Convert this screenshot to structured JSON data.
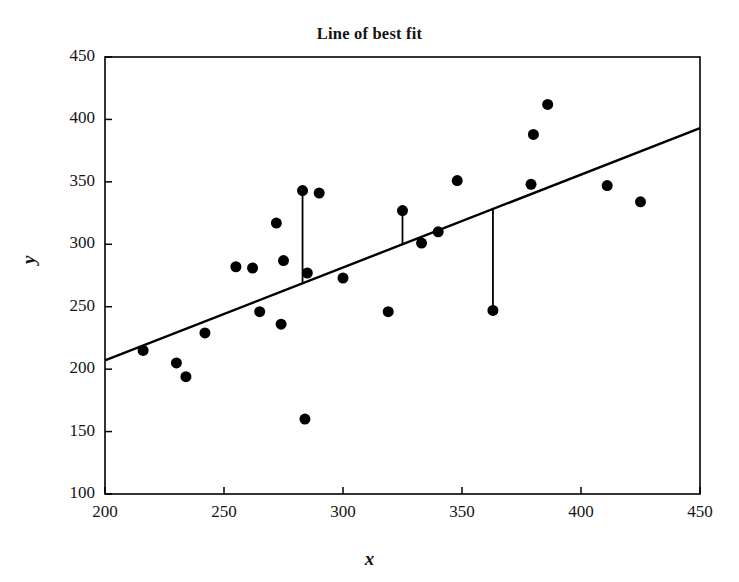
{
  "chart_data": {
    "type": "scatter",
    "title": "Line of best fit",
    "xlabel": "x",
    "ylabel": "y",
    "xlim": [
      200,
      450
    ],
    "ylim": [
      100,
      450
    ],
    "xticks": [
      200,
      250,
      300,
      350,
      400,
      450
    ],
    "yticks": [
      100,
      150,
      200,
      250,
      300,
      350,
      400,
      450
    ],
    "grid": false,
    "legend": null,
    "marker_color": "#000000",
    "line_color": "#000000",
    "marker_size": 11,
    "points": [
      {
        "x": 216,
        "y": 215
      },
      {
        "x": 230,
        "y": 205
      },
      {
        "x": 234,
        "y": 194
      },
      {
        "x": 242,
        "y": 229
      },
      {
        "x": 255,
        "y": 282
      },
      {
        "x": 262,
        "y": 281
      },
      {
        "x": 265,
        "y": 246
      },
      {
        "x": 272,
        "y": 317
      },
      {
        "x": 274,
        "y": 236
      },
      {
        "x": 275,
        "y": 287
      },
      {
        "x": 283,
        "y": 343
      },
      {
        "x": 284,
        "y": 160
      },
      {
        "x": 285,
        "y": 277
      },
      {
        "x": 290,
        "y": 341
      },
      {
        "x": 300,
        "y": 273
      },
      {
        "x": 319,
        "y": 246
      },
      {
        "x": 325,
        "y": 327
      },
      {
        "x": 333,
        "y": 301
      },
      {
        "x": 340,
        "y": 310
      },
      {
        "x": 348,
        "y": 351
      },
      {
        "x": 363,
        "y": 247
      },
      {
        "x": 379,
        "y": 348
      },
      {
        "x": 380,
        "y": 388
      },
      {
        "x": 386,
        "y": 412
      },
      {
        "x": 411,
        "y": 347
      },
      {
        "x": 425,
        "y": 334
      }
    ],
    "fit_line": {
      "label": "line of best fit",
      "x_start": 200,
      "y_start": 207,
      "x_end": 450,
      "y_end": 393,
      "slope": 0.744,
      "intercept": 58.2
    },
    "residual_segments": [
      {
        "x": 283,
        "y_point": 343,
        "y_line": 269
      },
      {
        "x": 325,
        "y_point": 327,
        "y_line": 300
      },
      {
        "x": 363,
        "y_point": 247,
        "y_line": 328
      }
    ]
  }
}
